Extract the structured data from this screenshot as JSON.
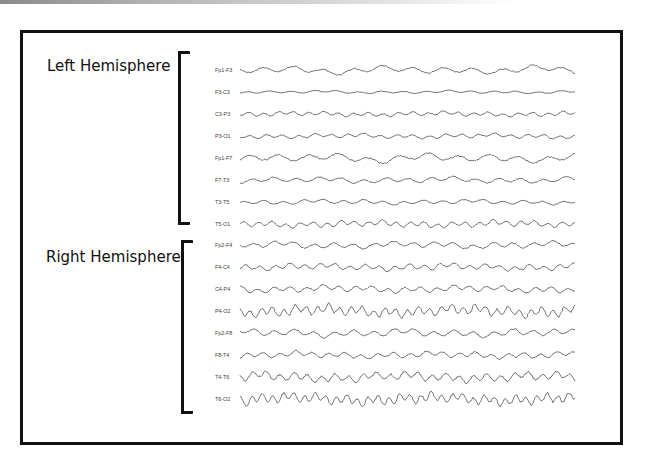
{
  "figure": {
    "left_group": {
      "title": "Left Hemisphere",
      "channels": [
        "Fp1-F3",
        "F3-C3",
        "C3-P3",
        "P3-O1",
        "Fp1-F7",
        "F7-T3",
        "T3-T5",
        "T5-O1"
      ]
    },
    "right_group": {
      "title": "Right Hemisphere",
      "channels": [
        "Fp2-F4",
        "F4-C4",
        "C4-P4",
        "P4-O2",
        "Fp2-F8",
        "F8-T4",
        "T4-T6",
        "T6-O2"
      ]
    },
    "trace_style": {
      "color": "#555555",
      "amplitude": [
        4,
        1.5,
        2.5,
        2.5,
        4.5,
        3,
        2.5,
        3.5,
        3.5,
        3.5,
        3.5,
        6,
        4,
        3.5,
        5,
        6
      ],
      "frequency": [
        0.6,
        0.8,
        1.2,
        1.1,
        0.6,
        0.8,
        0.9,
        1.3,
        0.9,
        1.2,
        1.1,
        1.6,
        0.9,
        1.1,
        1.3,
        1.7
      ]
    }
  }
}
